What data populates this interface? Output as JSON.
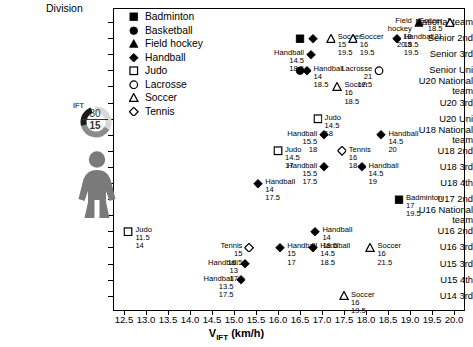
{
  "axes": {
    "y_title": "Division",
    "x_title_main": "V",
    "x_title_sub": "IFT",
    "x_title_units": " (km/h)",
    "x_ticks": [
      "12.5",
      "13.0",
      "13.5",
      "14.0",
      "14.5",
      "15.0",
      "15.5",
      "16.0",
      "16.5",
      "17.0",
      "17.5",
      "18.0",
      "18.5",
      "19.0",
      "19.5",
      "20.0"
    ],
    "y_ticks": [
      "National team",
      "Senior 2nd",
      "Senior 3rd",
      "Senior Uni",
      "U20 National\nteam",
      "U20 3rd",
      "U20 Uni",
      "U18 National\nteam",
      "U18 2nd",
      "U18 3rd",
      "U18 4th",
      "U17 2nd",
      "U16 National\nteam",
      "U16 2nd",
      "U16 3rd",
      "U15 3rd",
      "U15 4th",
      "U14 3rd"
    ]
  },
  "legend": {
    "title": "Division",
    "items": [
      {
        "label": "Badminton",
        "symbol": "filled-square"
      },
      {
        "label": "Basketball",
        "symbol": "filled-circle"
      },
      {
        "label": "Field hockey",
        "symbol": "filled-triangle"
      },
      {
        "label": "Handball",
        "symbol": "filled-diamond"
      },
      {
        "label": "Judo",
        "symbol": "open-square"
      },
      {
        "label": "Lacrosse",
        "symbol": "open-circle"
      },
      {
        "label": "Soccer",
        "symbol": "open-triangle"
      },
      {
        "label": "Tennis",
        "symbol": "open-diamond"
      }
    ]
  },
  "ift_widget": {
    "caption": "IFT",
    "numerator": "30",
    "denominator": "15",
    "colors": {
      "light": "#d9d9d9",
      "mid": "#8c8c8c",
      "dark": "#1a1a1a",
      "figure": "#7a7a7a"
    }
  },
  "chart_data": {
    "type": "scatter",
    "title": "",
    "xlabel": "V_IFT (km/h)",
    "ylabel": "Division",
    "xlim": [
      12.25,
      20.25
    ],
    "grid": false,
    "legend_position": "top-left-inside",
    "categories": [
      "National team",
      "Senior 2nd",
      "Senior 3rd",
      "Senior Uni",
      "U20 National team",
      "U20 3rd",
      "U20 Uni",
      "U18 National team",
      "U18 2nd",
      "U18 3rd",
      "U18 4th",
      "U17 2nd",
      "U16 National team",
      "U16 2nd",
      "U16 3rd",
      "U15 3rd",
      "U15 4th",
      "U14 3rd"
    ],
    "points": [
      {
        "sport": "Badminton",
        "x": 16.5,
        "division": "Senior 2nd",
        "n": "",
        "age": "",
        "label_pos": "none"
      },
      {
        "sport": "Handball",
        "x": 16.8,
        "division": "Senior 2nd",
        "n": "",
        "age": "",
        "label_pos": "none"
      },
      {
        "sport": "Soccer",
        "x": 17.2,
        "division": "Senior 2nd",
        "n": "15",
        "age": "19.5",
        "label_pos": "right"
      },
      {
        "sport": "Soccer",
        "x": 17.7,
        "division": "Senior 2nd",
        "n": "16",
        "age": "19.5",
        "label_pos": "right"
      },
      {
        "sport": "Field hockey",
        "x": 19.2,
        "division": "National team",
        "n": "18",
        "age": "20.5",
        "label_pos": "left"
      },
      {
        "sport": "Soccer",
        "x": 19.9,
        "division": "National team",
        "n": "18.5",
        "age": "21",
        "label_pos": "left"
      },
      {
        "sport": "Handball",
        "x": 18.7,
        "division": "Senior 2nd",
        "n": "18.5",
        "age": "19.5",
        "label_pos": "right"
      },
      {
        "sport": "Handball",
        "x": 16.75,
        "division": "Senior 3rd",
        "n": "14.5",
        "age": "18.5",
        "label_pos": "left"
      },
      {
        "sport": "Basketball",
        "x": 16.5,
        "division": "Senior Uni",
        "n": "",
        "age": "",
        "label_pos": "none"
      },
      {
        "sport": "Handball",
        "x": 16.65,
        "division": "Senior Uni",
        "n": "14",
        "age": "18.5",
        "label_pos": "right"
      },
      {
        "sport": "Lacrosse",
        "x": 18.3,
        "division": "Senior Uni",
        "n": "21",
        "age": "17.5",
        "label_pos": "left"
      },
      {
        "sport": "Soccer",
        "x": 17.35,
        "division": "U20 National team",
        "n": "16",
        "age": "18.5",
        "label_pos": "right"
      },
      {
        "sport": "Judo",
        "x": 16.9,
        "division": "U20 Uni",
        "n": "14.5",
        "age": "18",
        "label_pos": "right"
      },
      {
        "sport": "Handball",
        "x": 17.05,
        "division": "U18 National team",
        "n": "15.5",
        "age": "18",
        "label_pos": "left"
      },
      {
        "sport": "Handball",
        "x": 18.35,
        "division": "U18 National team",
        "n": "14.5",
        "age": "20",
        "label_pos": "right"
      },
      {
        "sport": "Judo",
        "x": 16.0,
        "division": "U18 2nd",
        "n": "14.5",
        "age": "17",
        "label_pos": "right"
      },
      {
        "sport": "Tennis",
        "x": 17.45,
        "division": "U18 2nd",
        "n": "16",
        "age": "18",
        "label_pos": "right"
      },
      {
        "sport": "Handball",
        "x": 17.05,
        "division": "U18 3rd",
        "n": "15.5",
        "age": "17.5",
        "label_pos": "left"
      },
      {
        "sport": "Handball",
        "x": 17.9,
        "division": "U18 3rd",
        "n": "14.5",
        "age": "19",
        "label_pos": "right"
      },
      {
        "sport": "Handball",
        "x": 15.55,
        "division": "U18 4th",
        "n": "14",
        "age": "17.5",
        "label_pos": "right"
      },
      {
        "sport": "Badminton",
        "x": 18.75,
        "division": "U17 2nd",
        "n": "17",
        "age": "19.5",
        "label_pos": "right"
      },
      {
        "sport": "Judo",
        "x": 12.6,
        "division": "U16 2nd",
        "n": "11.5",
        "age": "14",
        "label_pos": "right"
      },
      {
        "sport": "Handball",
        "x": 16.85,
        "division": "U16 2nd",
        "n": "14",
        "age": "18.5",
        "label_pos": "right"
      },
      {
        "sport": "Tennis",
        "x": 15.35,
        "division": "U16 3rd",
        "n": "15",
        "age": "16.5",
        "label_pos": "left"
      },
      {
        "sport": "Handball",
        "x": 16.05,
        "division": "U16 3rd",
        "n": "15",
        "age": "17",
        "label_pos": "right"
      },
      {
        "sport": "Handball",
        "x": 16.8,
        "division": "U16 3rd",
        "n": "14.5",
        "age": "18.5",
        "label_pos": "right"
      },
      {
        "sport": "Soccer",
        "x": 18.1,
        "division": "U16 3rd",
        "n": "16",
        "age": "21.5",
        "label_pos": "right"
      },
      {
        "sport": "Handball",
        "x": 15.25,
        "division": "U15 3rd",
        "n": "13",
        "age": "17",
        "label_pos": "left"
      },
      {
        "sport": "Handball",
        "x": 15.15,
        "division": "U15 4th",
        "n": "13.5",
        "age": "17.5",
        "label_pos": "left"
      },
      {
        "sport": "Soccer",
        "x": 17.5,
        "division": "U14 3rd",
        "n": "16",
        "age": "19.5",
        "label_pos": "right"
      }
    ]
  }
}
